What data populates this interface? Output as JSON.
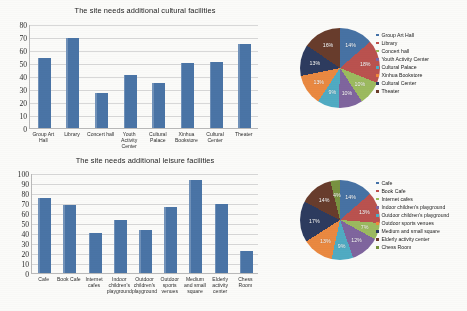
{
  "page": {
    "background": "#fbfbf9",
    "bar_color": "#4a74a6",
    "palette": [
      "#4472a8",
      "#c0504d",
      "#9bbb59",
      "#8064a2",
      "#4bacc6",
      "#f0883a",
      "#2c3b62",
      "#6b3b2a",
      "#77933c"
    ]
  },
  "charts": [
    {
      "title": "The site needs additional cultural facilities",
      "chart_data": {
        "type": "bar",
        "title": "The site needs additional cultural facilities",
        "xlabel": "",
        "ylabel": "",
        "ylim": [
          0,
          80
        ],
        "yticks": [
          0,
          10,
          20,
          30,
          40,
          50,
          60,
          70,
          80
        ],
        "grid": true,
        "legend": "none",
        "categories": [
          "Group Art Hall",
          "Library",
          "Concert hall",
          "Youth Activity Center",
          "Cultural Palace",
          "Xinhua Bookstore",
          "Cultural Center",
          "Theater"
        ],
        "values": [
          54,
          69,
          27,
          41,
          35,
          50,
          51,
          65
        ]
      }
    },
    {
      "title": "The site needs additional leisure facilities",
      "chart_data": {
        "type": "bar",
        "title": "The site needs additional leisure facilities",
        "xlabel": "",
        "ylabel": "",
        "ylim": [
          0,
          100
        ],
        "yticks": [
          0,
          10,
          20,
          30,
          40,
          50,
          60,
          70,
          80,
          90,
          100
        ],
        "grid": true,
        "legend": "none",
        "categories": [
          "Cafe",
          "Book Cafe",
          "Internet cafes",
          "Indoor children's playground",
          "Outdoor children's playground",
          "Outdoor sports venues",
          "Medium and small square",
          "Elderly activity center",
          "Chess Room"
        ],
        "values": [
          75,
          68,
          40,
          53,
          43,
          66,
          93,
          69,
          22
        ]
      }
    }
  ],
  "pies": [
    {
      "chart_data": {
        "type": "pie",
        "title": "",
        "legend_position": "right",
        "labels": [
          "Group Art Hall",
          "Library",
          "Concert hall",
          "Youth Activity Center",
          "Cultural Palace",
          "Xinhua Bookstore",
          "Cultural Center",
          "Theater"
        ],
        "values": [
          14,
          18,
          10,
          10,
          9,
          13,
          13,
          16
        ],
        "value_labels": [
          "14%",
          "18%",
          "10%",
          "10%",
          "9%",
          "13%",
          "13%",
          "16%"
        ],
        "colors": [
          "#4472a8",
          "#c0504d",
          "#9bbb59",
          "#8064a2",
          "#4bacc6",
          "#f0883a",
          "#2c3b62",
          "#6b3b2a"
        ]
      }
    },
    {
      "chart_data": {
        "type": "pie",
        "title": "",
        "legend_position": "right",
        "labels": [
          "Cafe",
          "Book Cafe",
          "Internet cafes",
          "Indoor children's playground",
          "Outdoor children's playground",
          "Outdoor sports venues",
          "Medium and small square",
          "Elderly activity center",
          "Chess Room"
        ],
        "values": [
          14,
          13,
          7,
          12,
          9,
          13,
          17,
          14,
          4
        ],
        "value_labels": [
          "14%",
          "13%",
          "7%",
          "12%",
          "9%",
          "13%",
          "17%",
          "14%",
          "4%"
        ],
        "colors": [
          "#4472a8",
          "#c0504d",
          "#9bbb59",
          "#8064a2",
          "#4bacc6",
          "#f0883a",
          "#2c3b62",
          "#6b3b2a",
          "#77933c"
        ]
      }
    }
  ]
}
